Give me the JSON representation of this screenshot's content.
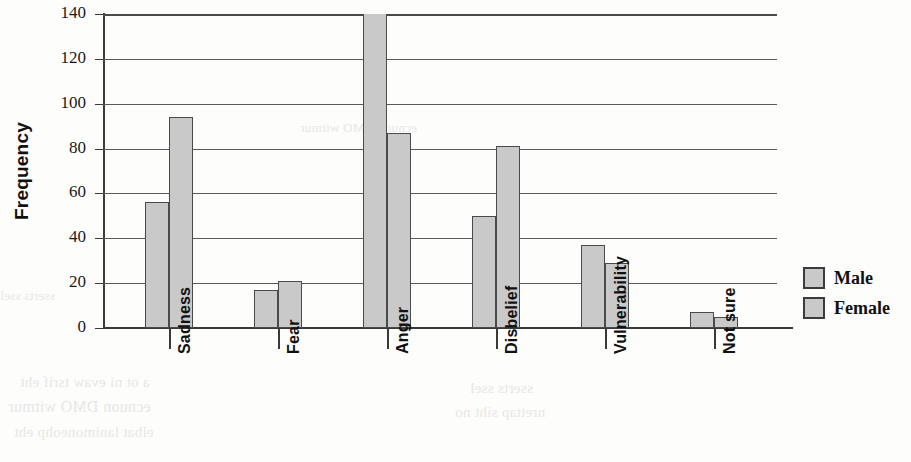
{
  "chart_data": {
    "type": "bar",
    "title": "",
    "xlabel": "",
    "ylabel": "Frequency",
    "ylim": [
      0,
      140
    ],
    "yticks": [
      0,
      20,
      40,
      60,
      80,
      100,
      120,
      140
    ],
    "grid": true,
    "legend_position": "right",
    "categories": [
      "Sadness",
      "Fear",
      "Anger",
      "Disbelief",
      "Vulnerability",
      "Not sure"
    ],
    "series": [
      {
        "name": "Male",
        "values": [
          56,
          17,
          145,
          50,
          37,
          7
        ],
        "color": "#c9c9c9",
        "clipped_values": [
          false,
          false,
          true,
          false,
          false,
          false
        ]
      },
      {
        "name": "Female",
        "values": [
          94,
          21,
          87,
          81,
          29,
          5
        ],
        "color": "#c9c9c9",
        "clipped_values": [
          false,
          false,
          false,
          false,
          false,
          false
        ]
      }
    ]
  },
  "legend": {
    "items": [
      {
        "label": "Male"
      },
      {
        "label": "Female"
      }
    ]
  },
  "artifacts": {
    "bleed_text": [
      "a ot ni evaw tsrif eht",
      "ecnuon DMO witmur",
      "elbat lanimoneohp eht",
      "sserts ssel",
      "nrettap siht no"
    ]
  }
}
